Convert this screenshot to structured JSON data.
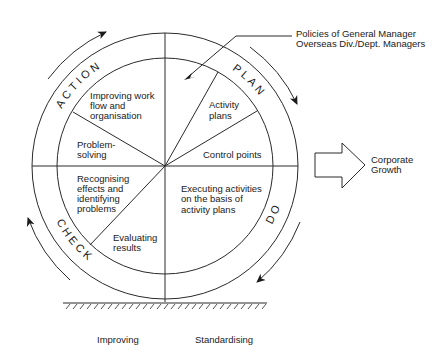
{
  "diagram": {
    "phases": [
      {
        "id": "plan",
        "label": "PLAN"
      },
      {
        "id": "do",
        "label": "DO"
      },
      {
        "id": "check",
        "label": "CHECK"
      },
      {
        "id": "action",
        "label": "ACTION"
      }
    ],
    "segments": {
      "improving_work_flow": [
        "Improving work",
        "flow and",
        "organisation"
      ],
      "problem_solving": [
        "Problem-",
        "solving"
      ],
      "recognising_effects": [
        "Recognising",
        "effects and",
        "identifying",
        "problems"
      ],
      "evaluating_results": [
        "Evaluating",
        "results"
      ],
      "executing_activities": [
        "Executing activities",
        "on the basis of",
        "activity plans"
      ],
      "control_points": [
        "Control points"
      ],
      "activity_plans": [
        "Activity",
        "plans"
      ]
    },
    "policies_callout": [
      "Policies of General Manager",
      "Overseas Div./Dept. Managers"
    ],
    "growth_arrow_label": [
      "Corporate",
      "Growth"
    ],
    "bottom_labels": {
      "left": "Improving",
      "right": "Standardising"
    }
  }
}
